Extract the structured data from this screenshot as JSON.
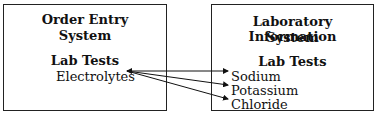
{
  "left_box": {
    "title_line1": "Order Entry",
    "title_line2": "System",
    "section": "Lab Tests",
    "items": [
      "Electrolytes"
    ]
  },
  "right_box": {
    "title_line1": "Laboratory Information",
    "title_line2": "System",
    "section": "Lab Tests",
    "items": [
      "Sodium",
      "Potassium",
      "Chloride"
    ]
  },
  "mappings": [
    {
      "from": "Electrolytes",
      "to": "Sodium"
    },
    {
      "from": "Electrolytes",
      "to": "Potassium"
    },
    {
      "from": "Electrolytes",
      "to": "Chloride"
    }
  ]
}
